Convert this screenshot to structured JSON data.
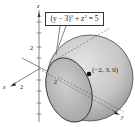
{
  "figure": {
    "type": "3d-surface-diagram",
    "axes": {
      "x_label": "x",
      "y_label": "y",
      "z_label": "z",
      "x_tick_label": "2",
      "z_tick_label": "2",
      "y_tick_label": "2"
    },
    "equation_callout": {
      "lhs_a": "(y − 3)",
      "exp_a": "2",
      "plus": " + z",
      "exp_b": "2",
      "rhs": " = 5"
    },
    "center_point": {
      "label": "(−2, 3, 0)"
    },
    "colors": {
      "sphere_fill": "#c8c8c8",
      "sphere_shadow": "#8a8a8a",
      "trace_fill": "#b0b0b0",
      "line": "#222222"
    }
  }
}
